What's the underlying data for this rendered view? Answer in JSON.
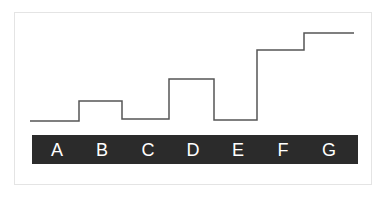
{
  "diagram": {
    "type": "step",
    "line_color": "#555555",
    "bar_color": "#2b2b2b",
    "label_color": "#ffffff",
    "segments": [
      {
        "label": "A",
        "x0": 30,
        "x1": 79,
        "y": 121,
        "label_x": 57
      },
      {
        "label": "B",
        "x0": 79,
        "x1": 122,
        "y": 101,
        "label_x": 102
      },
      {
        "label": "C",
        "x0": 122,
        "x1": 169,
        "y": 119,
        "label_x": 148
      },
      {
        "label": "D",
        "x0": 169,
        "x1": 214,
        "y": 79,
        "label_x": 193
      },
      {
        "label": "E",
        "x0": 214,
        "x1": 257,
        "y": 120,
        "label_x": 238
      },
      {
        "label": "F",
        "x0": 257,
        "x1": 304,
        "y": 50,
        "label_x": 283
      },
      {
        "label": "G",
        "x0": 304,
        "x1": 354,
        "y": 33,
        "label_x": 329
      }
    ]
  },
  "labels": {
    "a": "A",
    "b": "B",
    "c": "C",
    "d": "D",
    "e": "E",
    "f": "F",
    "g": "G"
  },
  "chart_data": {
    "type": "line",
    "title": "",
    "xlabel": "",
    "ylabel": "",
    "categories": [
      "A",
      "B",
      "C",
      "D",
      "E",
      "F",
      "G"
    ],
    "values": [
      1,
      2,
      1,
      3,
      1,
      5,
      6
    ],
    "grid": false,
    "legend": null,
    "step": true
  }
}
